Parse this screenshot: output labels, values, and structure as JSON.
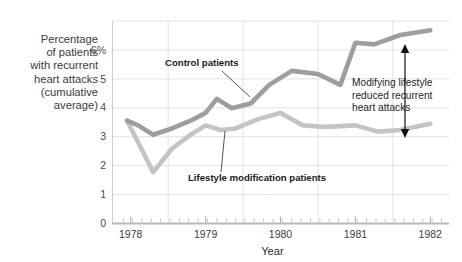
{
  "chart_data": {
    "type": "line",
    "title": "",
    "xlabel": "Year",
    "ylabel": "Percentage of patients with recurrent heart attacks (cumulative average)",
    "ylabel_lines": [
      "Percentage",
      "of patients",
      "with recurrent",
      "heart attacks",
      "(cumulative",
      "average)"
    ],
    "ylim": [
      0,
      6.5
    ],
    "yticks": [
      0,
      1,
      2,
      3,
      4,
      5,
      6
    ],
    "yticklabels": [
      "0",
      "1",
      "2",
      "3",
      "4",
      "5",
      "6%"
    ],
    "xlim": [
      1977.75,
      1982.25
    ],
    "xticklabels": [
      "1978",
      "1979",
      "1980",
      "1981",
      "1982"
    ],
    "xtickvalues": [
      1978,
      1979,
      1980,
      1981,
      1982
    ],
    "grid": true,
    "legend": "inline-annotations",
    "series": [
      {
        "name": "Control patients",
        "color": "#9e9e9e",
        "x": [
          1977.95,
          1978.1,
          1978.3,
          1978.55,
          1978.8,
          1979.0,
          1979.15,
          1979.35,
          1979.6,
          1979.85,
          1980.15,
          1980.5,
          1980.8,
          1981.0,
          1981.25,
          1981.6,
          1982.0
        ],
        "y": [
          3.3,
          3.15,
          2.85,
          3.05,
          3.3,
          3.55,
          4.0,
          3.7,
          3.85,
          4.45,
          4.9,
          4.8,
          4.45,
          5.8,
          5.75,
          6.05,
          6.2
        ]
      },
      {
        "name": "Lifestyle modification patients",
        "color": "#c4c4c4",
        "x": [
          1977.95,
          1978.1,
          1978.3,
          1978.55,
          1978.8,
          1979.0,
          1979.2,
          1979.4,
          1979.7,
          1980.0,
          1980.3,
          1980.6,
          1981.0,
          1981.3,
          1981.6,
          1982.0
        ],
        "y": [
          3.3,
          2.6,
          1.65,
          2.4,
          2.85,
          3.15,
          3.0,
          3.05,
          3.35,
          3.55,
          3.15,
          3.1,
          3.15,
          2.95,
          3.0,
          3.2
        ]
      }
    ],
    "annotations": [
      {
        "id": "control-label",
        "text": "Control patients",
        "x": 165,
        "y": 66,
        "leader_from": [
          222,
          71
        ],
        "leader_to": [
          250,
          97
        ]
      },
      {
        "id": "lifestyle-label",
        "text": "Lifestyle modification patients",
        "x": 188,
        "y": 181,
        "leader_from": [
          221,
          172
        ],
        "leader_to": [
          225,
          131
        ]
      },
      {
        "id": "gap-annotation",
        "lines": [
          "Modifying lifestyle",
          "reduced recurrent",
          "heart attacks"
        ],
        "x": 352,
        "y": 86,
        "arrow_x": 405,
        "arrow_top": 44,
        "arrow_bottom": 138
      }
    ]
  },
  "axis": {
    "x_title": "Year"
  }
}
